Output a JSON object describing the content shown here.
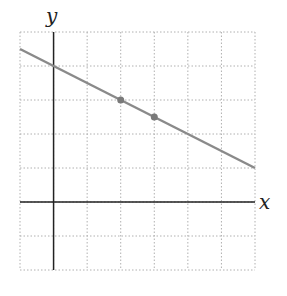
{
  "chart_data": {
    "type": "line",
    "title": "",
    "xlabel": "x",
    "ylabel": "y",
    "xlim": [
      -1,
      6
    ],
    "ylim": [
      -2,
      5
    ],
    "grid": true,
    "grid_style": "dotted",
    "tick_labels": false,
    "series": [
      {
        "name": "line",
        "x": [
          -1,
          6
        ],
        "y": [
          4.5,
          1
        ],
        "slope": -0.5,
        "intercept": 4,
        "color": "#8a8a8a"
      }
    ],
    "points": [
      {
        "x": 2,
        "y": 3
      },
      {
        "x": 3,
        "y": 2.5
      }
    ],
    "colors": {
      "line": "#8a8a8a",
      "points": "#7a7a7a",
      "axes": "#222222",
      "grid": "#b0b0b0"
    }
  }
}
